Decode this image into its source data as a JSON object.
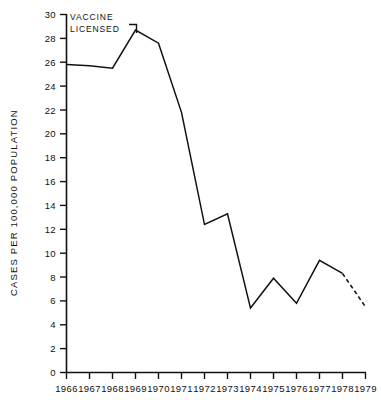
{
  "chart_data": {
    "type": "line",
    "title": "",
    "xlabel": "",
    "ylabel": "CASES PER 100,000 POPULATION",
    "x": [
      1966,
      1967,
      1968,
      1969,
      1970,
      1971,
      1972,
      1973,
      1974,
      1975,
      1976,
      1977,
      1978,
      1979
    ],
    "values": [
      25.8,
      25.7,
      25.5,
      28.7,
      27.6,
      21.8,
      12.4,
      13.3,
      5.4,
      7.9,
      5.8,
      9.4,
      8.3,
      5.5
    ],
    "series": [
      {
        "name": "Cases per 100,000 population",
        "values": [
          25.8,
          25.7,
          25.5,
          28.7,
          27.6,
          21.8,
          12.4,
          13.3,
          5.4,
          7.9,
          5.8,
          9.4,
          8.3,
          5.5
        ]
      }
    ],
    "xtick_labels": [
      "1966",
      "1967",
      "1968",
      "1969",
      "1970",
      "1971",
      "1972",
      "1973",
      "1974",
      "1975",
      "1976",
      "1977",
      "1978",
      "1979"
    ],
    "ytick_labels": [
      "0",
      "2",
      "4",
      "6",
      "8",
      "10",
      "12",
      "14",
      "16",
      "18",
      "20",
      "22",
      "24",
      "26",
      "28",
      "30"
    ],
    "ytick_values": [
      0,
      2,
      4,
      6,
      8,
      10,
      12,
      14,
      16,
      18,
      20,
      22,
      24,
      26,
      28,
      30
    ],
    "ylim": [
      0,
      30
    ],
    "xlim": [
      1966,
      1979
    ],
    "grid": false,
    "legend": false,
    "legend_position": "none",
    "dashed_segment": {
      "from_x": 1978,
      "to_x": 1979,
      "note": "provisional"
    },
    "annotations": [
      {
        "name": "vaccine-licensed",
        "line1": "VACCINE",
        "line2": "LICENSED",
        "points_to_x": 1969,
        "marker": "bracket"
      }
    ],
    "line_color": "#111111",
    "axis_color": "#111111",
    "background_color": "#ffffff"
  }
}
